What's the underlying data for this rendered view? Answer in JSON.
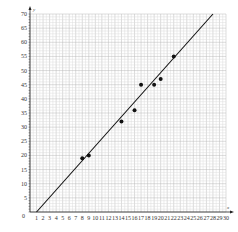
{
  "chart_data": {
    "type": "scatter",
    "title": "",
    "xlabel": "x",
    "ylabel": "y",
    "xlim": [
      0,
      30
    ],
    "ylim": [
      0,
      70
    ],
    "grid": true,
    "minor_grid": true,
    "x_ticks": [
      1,
      2,
      3,
      4,
      5,
      6,
      7,
      8,
      9,
      10,
      11,
      12,
      13,
      14,
      15,
      16,
      17,
      18,
      19,
      20,
      21,
      22,
      23,
      24,
      25,
      26,
      27,
      28,
      29,
      30
    ],
    "y_ticks": [
      5,
      10,
      15,
      20,
      25,
      30,
      35,
      40,
      45,
      50,
      55,
      60,
      65,
      70
    ],
    "origin_label": "0",
    "series": [
      {
        "name": "data",
        "type": "scatter",
        "points": [
          {
            "x": 8,
            "y": 19
          },
          {
            "x": 9,
            "y": 20
          },
          {
            "x": 14,
            "y": 32
          },
          {
            "x": 16,
            "y": 36
          },
          {
            "x": 17,
            "y": 45
          },
          {
            "x": 19,
            "y": 45
          },
          {
            "x": 20,
            "y": 47
          },
          {
            "x": 22,
            "y": 55
          }
        ]
      },
      {
        "name": "line of best fit",
        "type": "line",
        "points": [
          {
            "x": 1,
            "y": 0
          },
          {
            "x": 28,
            "y": 70
          }
        ]
      }
    ],
    "colors": {
      "grid_major": "#b8b8b8",
      "grid_minor": "#dcdcdc",
      "axis": "#222222",
      "points": "#111111",
      "line": "#111111"
    }
  }
}
